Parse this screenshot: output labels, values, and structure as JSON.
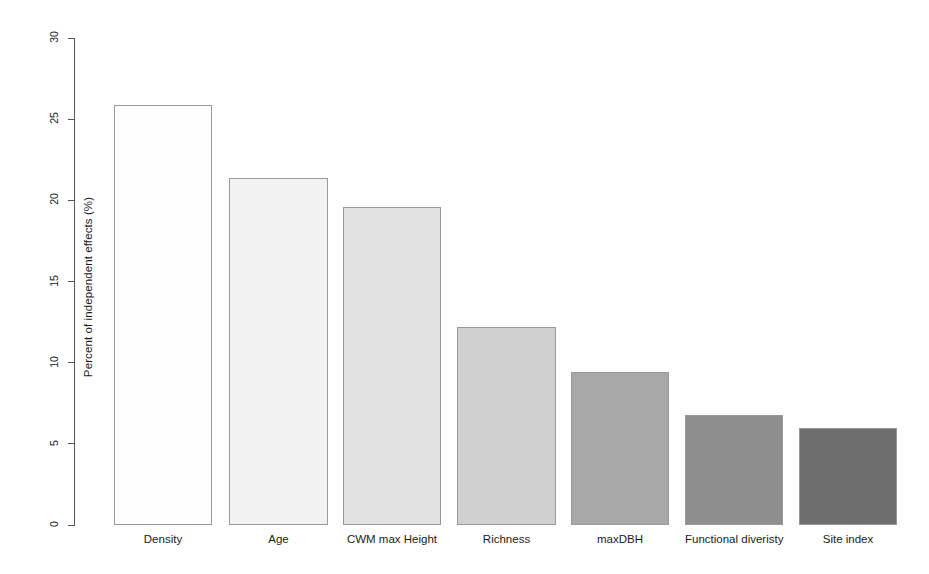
{
  "chart_data": {
    "type": "bar",
    "title": "",
    "subtitle": "",
    "xlabel": "",
    "ylabel": "Percent of independent effects (%)",
    "categories": [
      "Density",
      "Age",
      "CWM max Height",
      "Richness",
      "maxDBH",
      "Functional diveristy",
      "Site index"
    ],
    "values": [
      25.9,
      21.4,
      19.6,
      12.2,
      9.4,
      6.8,
      6.0
    ],
    "bar_colors": [
      "#fefefe",
      "#f2f2f2",
      "#e2e2e2",
      "#d0d0d0",
      "#a8a8a8",
      "#8e8e8e",
      "#6e6e6e"
    ],
    "bar_border_color": "#9a9a9a",
    "ylim": [
      0,
      30
    ],
    "yticks": [
      0,
      5,
      10,
      15,
      20,
      25,
      30
    ],
    "ytick_labels": [
      "0",
      "5",
      "10",
      "15",
      "20",
      "25",
      "30"
    ],
    "grid": false,
    "legend": null,
    "axis_color": "#555555"
  },
  "axis": {
    "y_title": "Percent of independent effects (%)"
  }
}
